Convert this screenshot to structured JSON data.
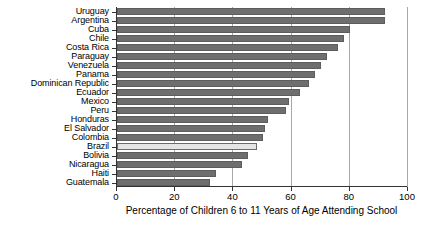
{
  "chart_data": {
    "type": "bar",
    "orientation": "horizontal",
    "title": "",
    "xlabel": "Percentage of Children 6 to 11 Years of Age Attending School",
    "ylabel": "",
    "xlim": [
      0,
      100
    ],
    "xticks": [
      0,
      20,
      40,
      60,
      80,
      100
    ],
    "grid": true,
    "legend": "none",
    "categories": [
      "Uruguay",
      "Argentina",
      "Cuba",
      "Chile",
      "Costa Rica",
      "Paraguay",
      "Venezuela",
      "Panama",
      "Dominican Republic",
      "Ecuador",
      "Mexico",
      "Peru",
      "Honduras",
      "El Salvador",
      "Colombia",
      "Brazil",
      "Bolivia",
      "Nicaragua",
      "Haiti",
      "Guatemala"
    ],
    "values": [
      92,
      92,
      80,
      78,
      76,
      72,
      70,
      68,
      66,
      63,
      59,
      58,
      52,
      51,
      50,
      48,
      45,
      43,
      34,
      32
    ],
    "highlight_category": "Brazil",
    "colors": {
      "bar": "#6e6e6e",
      "bar_edge": "#5d5d5d",
      "highlight_bar": "#e4e4e4",
      "highlight_bar_edge": "#6b6b6b",
      "gridline": "#a8a8a8",
      "axis": "#333333",
      "text": "#000000",
      "background": "#ffffff"
    }
  }
}
